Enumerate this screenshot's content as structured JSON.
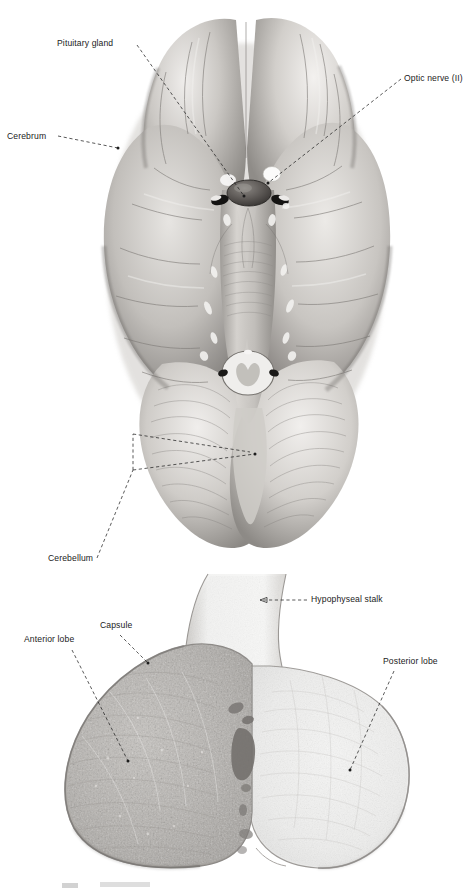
{
  "figure": {
    "type": "anatomical-plate",
    "subject": "Pituitary gland",
    "rendering": "grayscale photographic / histological plate",
    "panels": [
      {
        "id": "brain-inferior-view",
        "caption": "",
        "description": "Inferior (ventral) view of the human brain showing the pituitary gland, optic nerves, cerebrum and cerebellum"
      },
      {
        "id": "pituitary-section",
        "caption": "",
        "description": "Midsagittal histological section of the pituitary gland showing anterior lobe, posterior lobe, capsule and hypophyseal stalk"
      }
    ]
  },
  "brain_panel": {
    "labels": [
      {
        "id": "pituitary-gland",
        "text": "Pituitary gland",
        "x": 57,
        "y": 38,
        "anchor": "right"
      },
      {
        "id": "optic-nerve",
        "text": "Optic nerve (II)",
        "x": 404,
        "y": 73,
        "anchor": "left"
      },
      {
        "id": "cerebrum",
        "text": "Cerebrum",
        "x": 7,
        "y": 131,
        "anchor": "right"
      },
      {
        "id": "cerebellum",
        "text": "Cerebellum",
        "x": 48,
        "y": 553,
        "anchor": "right"
      }
    ]
  },
  "pituitary_panel": {
    "labels": [
      {
        "id": "hypophyseal-stalk",
        "text": "Hypophyseal stalk",
        "x": 311,
        "y": 594,
        "anchor": "left"
      },
      {
        "id": "capsule",
        "text": "Capsule",
        "x": 100,
        "y": 620,
        "anchor": "center"
      },
      {
        "id": "anterior-lobe",
        "text": "Anterior lobe",
        "x": 24,
        "y": 634,
        "anchor": "right"
      },
      {
        "id": "posterior-lobe",
        "text": "Posterior lobe",
        "x": 383,
        "y": 656,
        "anchor": "left"
      }
    ]
  },
  "colors": {
    "background": "#ffffff",
    "label_text": "#1b1b1b",
    "leader_line": "#232323",
    "brain_light": "#f2f0ee",
    "brain_mid": "#bfbcb8",
    "brain_dark": "#8a8784",
    "brain_shadow": "#5e5b58",
    "pituitary_anterior": "#b9b6b2",
    "pituitary_posterior": "#efefee",
    "pituitary_capsule": "#8f8c89",
    "pituitary_cleft": "#7b7875"
  }
}
